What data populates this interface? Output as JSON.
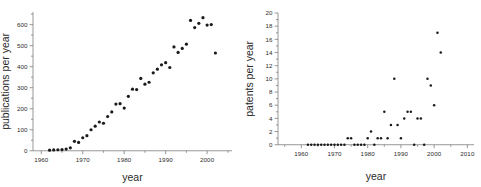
{
  "figure": {
    "name": "publications-and-patents-scatter-figure",
    "panel_count": 2,
    "background_color": "#ffffff",
    "point_color": "#1a1a1a",
    "axis_color": "#7d7d7d",
    "text_color": "#2b2b2b"
  },
  "chart_data": [
    {
      "type": "scatter",
      "name": "publications-per-year",
      "title": "",
      "xlabel": "year",
      "ylabel": "publications per year",
      "xlim": [
        1958,
        2006
      ],
      "ylim": [
        -20,
        660
      ],
      "xticks": [
        1960,
        1970,
        1980,
        1990,
        2000
      ],
      "xtick_labels": [
        "1960",
        "1970",
        "1980",
        "1990",
        "2000"
      ],
      "yticks": [
        0,
        100,
        200,
        300,
        400,
        500,
        600
      ],
      "ytick_labels": [
        "0",
        "100",
        "200",
        "300",
        "400",
        "500",
        "600"
      ],
      "xminor_step": 5,
      "yminor_step": 50,
      "grid": false,
      "legend": false,
      "marker": "filled-circle",
      "x": [
        1962,
        1963,
        1964,
        1965,
        1966,
        1967,
        1968,
        1969,
        1970,
        1971,
        1972,
        1973,
        1974,
        1975,
        1976,
        1977,
        1978,
        1979,
        1980,
        1981,
        1982,
        1983,
        1984,
        1985,
        1986,
        1987,
        1988,
        1989,
        1990,
        1991,
        1992,
        1993,
        1994,
        1995,
        1996,
        1997,
        1998,
        1999,
        2000,
        2001,
        2002
      ],
      "y": [
        3,
        4,
        5,
        6,
        8,
        14,
        45,
        40,
        62,
        72,
        100,
        117,
        137,
        131,
        163,
        185,
        222,
        224,
        203,
        259,
        293,
        291,
        344,
        317,
        326,
        371,
        388,
        409,
        419,
        396,
        494,
        468,
        487,
        507,
        620,
        586,
        606,
        633,
        598,
        600,
        465
      ]
    },
    {
      "type": "scatter",
      "name": "patents-per-year",
      "title": "",
      "xlabel": "year",
      "ylabel": "patents per year",
      "xlim": [
        1953,
        2012
      ],
      "ylim": [
        -0.8,
        20
      ],
      "xticks": [
        1960,
        1970,
        1980,
        1990,
        2000,
        2010
      ],
      "xtick_labels": [
        "1960",
        "1970",
        "1980",
        "1990",
        "2000",
        "2010"
      ],
      "yticks": [
        0,
        2,
        4,
        6,
        8,
        10,
        12,
        14,
        16,
        18,
        20
      ],
      "ytick_labels": [
        "0",
        "2",
        "4",
        "6",
        "8",
        "10",
        "12",
        "14",
        "16",
        "18",
        "20"
      ],
      "xminor_step": 5,
      "yminor_step": 1,
      "grid": false,
      "legend": false,
      "marker": "filled-circle",
      "x": [
        1962,
        1963,
        1964,
        1965,
        1966,
        1967,
        1968,
        1969,
        1970,
        1971,
        1972,
        1973,
        1974,
        1975,
        1976,
        1977,
        1978,
        1979,
        1980,
        1981,
        1982,
        1983,
        1984,
        1985,
        1986,
        1987,
        1988,
        1989,
        1990,
        1991,
        1992,
        1993,
        1994,
        1995,
        1996,
        1997,
        1998,
        1999,
        2000,
        2001,
        2002
      ],
      "y": [
        0,
        0,
        0,
        0,
        0,
        0,
        0,
        0,
        0,
        0,
        0,
        0,
        1,
        1,
        0,
        0,
        0,
        0,
        1,
        2,
        0,
        1,
        1,
        5,
        1,
        3,
        10,
        3,
        1,
        4,
        5,
        5,
        0,
        4,
        4,
        0,
        10,
        9,
        6,
        17,
        14
      ]
    }
  ]
}
